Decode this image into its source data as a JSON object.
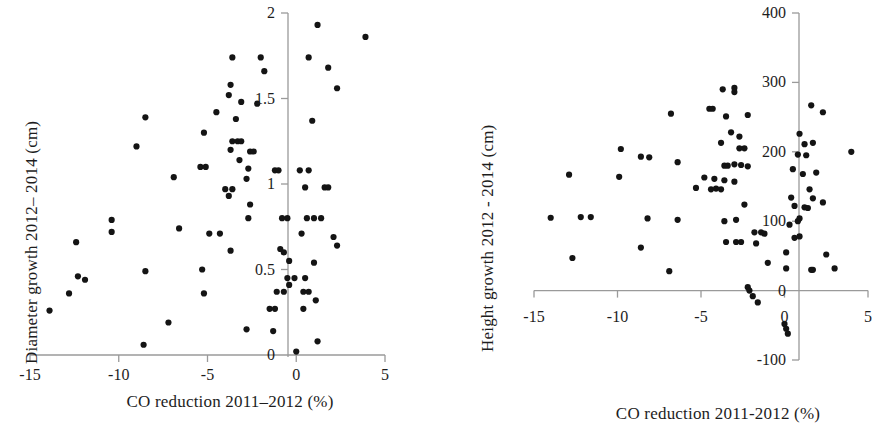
{
  "figure": {
    "background": "#ffffff",
    "point_color": "#141414",
    "axis_color": "#9a9a9a"
  },
  "panels": [
    {
      "id": "diameter-growth-panel",
      "chart_data": {
        "type": "scatter",
        "title": "",
        "xlabel": "CO reduction  2011–2012 (%)",
        "ylabel": "Diameter growth  2012– 2014 (cm)",
        "xlim": [
          -15,
          5
        ],
        "ylim": [
          0,
          2
        ],
        "xticks": [
          -15,
          -10,
          -5,
          0,
          5
        ],
        "xticklabels": [
          "-15",
          "-10",
          "-5",
          "0",
          "5"
        ],
        "yticks": [
          0,
          0.5,
          1,
          1.5,
          2
        ],
        "yticklabels": [
          "0",
          "0.5",
          "1",
          "1.5",
          "2"
        ],
        "grid": false,
        "legend": null,
        "points": [
          [
            1.2,
            1.93
          ],
          [
            3.9,
            1.86
          ],
          [
            -3.6,
            1.74
          ],
          [
            -2.0,
            1.74
          ],
          [
            0.7,
            1.74
          ],
          [
            -1.8,
            1.66
          ],
          [
            1.8,
            1.68
          ],
          [
            -3.7,
            1.58
          ],
          [
            2.3,
            1.56
          ],
          [
            -3.8,
            1.52
          ],
          [
            -3.1,
            1.48
          ],
          [
            -2.2,
            1.47
          ],
          [
            -4.5,
            1.42
          ],
          [
            -8.5,
            1.39
          ],
          [
            -3.4,
            1.38
          ],
          [
            0.9,
            1.37
          ],
          [
            -5.2,
            1.3
          ],
          [
            -3.6,
            1.25
          ],
          [
            -3.3,
            1.25
          ],
          [
            -3.1,
            1.25
          ],
          [
            -9.0,
            1.22
          ],
          [
            -3.7,
            1.2
          ],
          [
            -2.6,
            1.19
          ],
          [
            -2.4,
            1.19
          ],
          [
            -3.2,
            1.14
          ],
          [
            -5.4,
            1.1
          ],
          [
            -5.1,
            1.1
          ],
          [
            -2.7,
            1.09
          ],
          [
            -1.2,
            1.08
          ],
          [
            -1.0,
            1.08
          ],
          [
            0.2,
            1.08
          ],
          [
            0.7,
            1.08
          ],
          [
            -6.9,
            1.04
          ],
          [
            -2.8,
            1.03
          ],
          [
            0.5,
            0.98
          ],
          [
            1.6,
            0.98
          ],
          [
            1.8,
            0.98
          ],
          [
            -4.0,
            0.97
          ],
          [
            -3.6,
            0.97
          ],
          [
            -3.8,
            0.93
          ],
          [
            -2.6,
            0.88
          ],
          [
            -2.7,
            0.8
          ],
          [
            -0.8,
            0.8
          ],
          [
            -0.5,
            0.8
          ],
          [
            0.6,
            0.8
          ],
          [
            1.0,
            0.8
          ],
          [
            1.4,
            0.8
          ],
          [
            -10.4,
            0.79
          ],
          [
            -6.6,
            0.74
          ],
          [
            -10.4,
            0.72
          ],
          [
            -4.9,
            0.71
          ],
          [
            -4.3,
            0.71
          ],
          [
            0.3,
            0.71
          ],
          [
            2.1,
            0.69
          ],
          [
            2.3,
            0.64
          ],
          [
            -12.4,
            0.66
          ],
          [
            -3.7,
            0.61
          ],
          [
            -0.9,
            0.62
          ],
          [
            -0.7,
            0.6
          ],
          [
            -0.4,
            0.55
          ],
          [
            1.0,
            0.54
          ],
          [
            -8.5,
            0.49
          ],
          [
            -5.3,
            0.5
          ],
          [
            -0.5,
            0.45
          ],
          [
            -0.1,
            0.45
          ],
          [
            0.5,
            0.45
          ],
          [
            -11.9,
            0.44
          ],
          [
            -12.3,
            0.46
          ],
          [
            -0.4,
            0.41
          ],
          [
            -1.1,
            0.37
          ],
          [
            -0.7,
            0.37
          ],
          [
            0.4,
            0.37
          ],
          [
            0.7,
            0.37
          ],
          [
            -5.2,
            0.36
          ],
          [
            -12.8,
            0.36
          ],
          [
            1.1,
            0.32
          ],
          [
            -1.5,
            0.27
          ],
          [
            -1.2,
            0.27
          ],
          [
            0.4,
            0.27
          ],
          [
            -13.9,
            0.26
          ],
          [
            -7.2,
            0.19
          ],
          [
            -2.8,
            0.15
          ],
          [
            -1.3,
            0.14
          ],
          [
            1.2,
            0.08
          ],
          [
            -8.6,
            0.06
          ],
          [
            0.0,
            0.02
          ]
        ]
      }
    },
    {
      "id": "height-growth-panel",
      "chart_data": {
        "type": "scatter",
        "title": "",
        "xlabel": "CO reduction 2011-2012 (%)",
        "ylabel": "Height growth  2012 - 2014 (cm)",
        "xlim": [
          -15,
          5
        ],
        "ylim": [
          -100,
          400
        ],
        "xticks": [
          -15,
          -10,
          -5,
          0,
          5
        ],
        "xticklabels": [
          "-15",
          "-10",
          "-5",
          "0",
          "5"
        ],
        "yticks": [
          -100,
          0,
          100,
          200,
          300,
          400
        ],
        "yticklabels": [
          "-100",
          "0",
          "100",
          "200",
          "300",
          "400"
        ],
        "grid": false,
        "legend": null,
        "points": [
          [
            -3.7,
            290
          ],
          [
            -3.0,
            292
          ],
          [
            -3.0,
            286
          ],
          [
            1.6,
            267
          ],
          [
            -4.5,
            262
          ],
          [
            -4.3,
            262
          ],
          [
            2.3,
            257
          ],
          [
            -2.2,
            253
          ],
          [
            -3.5,
            251
          ],
          [
            -6.8,
            255
          ],
          [
            -3.2,
            228
          ],
          [
            -2.7,
            222
          ],
          [
            0.9,
            226
          ],
          [
            -3.8,
            213
          ],
          [
            -2.7,
            205
          ],
          [
            -2.4,
            205
          ],
          [
            1.2,
            211
          ],
          [
            1.7,
            213
          ],
          [
            -9.8,
            204
          ],
          [
            4.0,
            200
          ],
          [
            -8.6,
            193
          ],
          [
            -8.1,
            192
          ],
          [
            0.8,
            196
          ],
          [
            1.3,
            195
          ],
          [
            -6.4,
            185
          ],
          [
            -3.6,
            180
          ],
          [
            -3.4,
            180
          ],
          [
            -3.0,
            182
          ],
          [
            -2.6,
            181
          ],
          [
            -2.2,
            179
          ],
          [
            0.5,
            175
          ],
          [
            -12.9,
            167
          ],
          [
            -9.9,
            164
          ],
          [
            -4.8,
            163
          ],
          [
            -4.2,
            161
          ],
          [
            -3.6,
            159
          ],
          [
            -3.0,
            157
          ],
          [
            1.1,
            168
          ],
          [
            1.9,
            170
          ],
          [
            -5.3,
            148
          ],
          [
            -4.4,
            146
          ],
          [
            -4.1,
            147
          ],
          [
            -3.8,
            146
          ],
          [
            1.5,
            146
          ],
          [
            0.4,
            134
          ],
          [
            1.7,
            133
          ],
          [
            -2.4,
            124
          ],
          [
            2.3,
            127
          ],
          [
            0.6,
            122
          ],
          [
            1.2,
            120
          ],
          [
            1.4,
            119
          ],
          [
            -14.0,
            105
          ],
          [
            -12.2,
            106
          ],
          [
            -11.6,
            106
          ],
          [
            -8.2,
            104
          ],
          [
            -6.4,
            102
          ],
          [
            -3.6,
            100
          ],
          [
            -2.9,
            102
          ],
          [
            0.8,
            100
          ],
          [
            0.9,
            104
          ],
          [
            0.3,
            95
          ],
          [
            -1.8,
            84
          ],
          [
            -1.4,
            84
          ],
          [
            -1.2,
            82
          ],
          [
            0.6,
            76
          ],
          [
            0.9,
            78
          ],
          [
            -3.5,
            70
          ],
          [
            -2.9,
            70
          ],
          [
            -2.6,
            70
          ],
          [
            -1.7,
            68
          ],
          [
            -8.6,
            62
          ],
          [
            0.1,
            55
          ],
          [
            2.5,
            52
          ],
          [
            -12.7,
            47
          ],
          [
            -1.0,
            40
          ],
          [
            0.1,
            32
          ],
          [
            1.6,
            30
          ],
          [
            1.7,
            30
          ],
          [
            3.0,
            32
          ],
          [
            -6.9,
            28
          ],
          [
            -2.2,
            5
          ],
          [
            -2.1,
            0
          ],
          [
            -1.9,
            -8
          ],
          [
            -1.6,
            -17
          ],
          [
            0.0,
            -48
          ],
          [
            0.1,
            -55
          ],
          [
            0.2,
            -62
          ]
        ]
      }
    }
  ]
}
